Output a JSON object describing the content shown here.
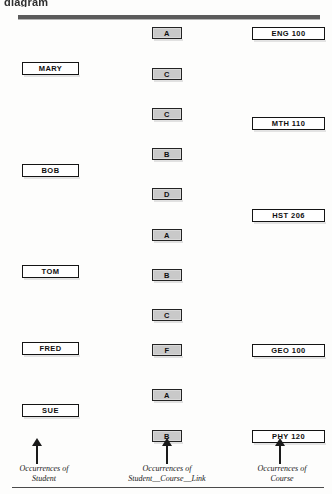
{
  "figure": {
    "clipped_header_text": "diagram",
    "type": "occurrence-diagram"
  },
  "columns": {
    "student": {
      "caption_line1": "Occurrences of",
      "caption_line2": "Student"
    },
    "link": {
      "caption_line1": "Occurrences of",
      "caption_line2": "Student__Course__Link"
    },
    "course": {
      "caption_line1": "Occurrences of",
      "caption_line2": "Course"
    }
  },
  "students": [
    {
      "label": "MARY",
      "top": 62
    },
    {
      "label": "BOB",
      "top": 164
    },
    {
      "label": "TOM",
      "top": 265
    },
    {
      "label": "FRED",
      "top": 342
    },
    {
      "label": "SUE",
      "top": 404
    }
  ],
  "grades": [
    {
      "label": "A",
      "top": 27
    },
    {
      "label": "C",
      "top": 68
    },
    {
      "label": "C",
      "top": 108
    },
    {
      "label": "B",
      "top": 148
    },
    {
      "label": "D",
      "top": 188
    },
    {
      "label": "A",
      "top": 229
    },
    {
      "label": "B",
      "top": 269
    },
    {
      "label": "C",
      "top": 309
    },
    {
      "label": "F",
      "top": 344
    },
    {
      "label": "A",
      "top": 389
    },
    {
      "label": "B",
      "top": 430
    }
  ],
  "courses": [
    {
      "label": "ENG 100",
      "top": 27
    },
    {
      "label": "MTH 110",
      "top": 117
    },
    {
      "label": "HST 206",
      "top": 209
    },
    {
      "label": "GEO 100",
      "top": 344
    },
    {
      "label": "PHY 120",
      "top": 430
    }
  ],
  "arrows": [
    {
      "name": "student-arrow",
      "left": 31
    },
    {
      "name": "link-arrow",
      "left": 161
    },
    {
      "name": "course-arrow",
      "left": 274
    }
  ],
  "colors": {
    "grade_fill": "#c9c9c9",
    "box_border": "#141414",
    "rule": "#5b5b5b",
    "text": "#0f0f0f"
  }
}
